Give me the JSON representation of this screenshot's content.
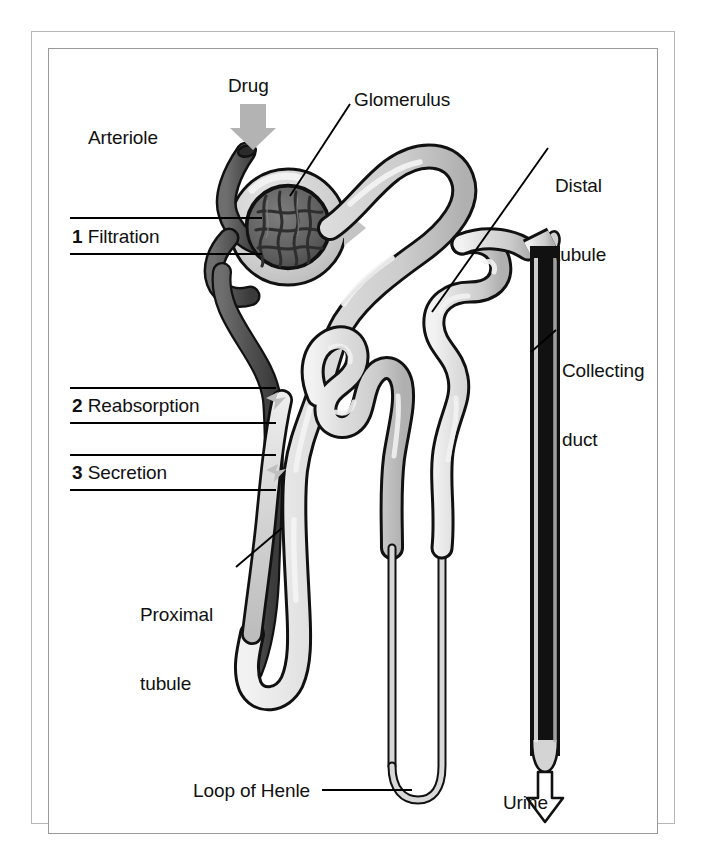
{
  "figure": {
    "domain": "Diagram",
    "background_color": "#ffffff",
    "frame": {
      "outer_border_color": "#b8b8b8",
      "inner_border_color": "#9a9a9a"
    }
  },
  "labels": {
    "arteriole": "Arteriole",
    "drug": "Drug",
    "glomerulus": "Glomerulus",
    "distal_tubule": "Distal\ntubule",
    "distal_tubule_line1": "Distal",
    "distal_tubule_line2": "tubule",
    "collecting_duct_line1": "Collecting",
    "collecting_duct_line2": "duct",
    "proximal_tubule_line1": "Proximal",
    "proximal_tubule_line2": "tubule",
    "loop_of_henle": "Loop of Henle",
    "urine": "Urine"
  },
  "process_steps": [
    {
      "number": "1",
      "name": "Filtration"
    },
    {
      "number": "2",
      "name": "Reabsorption"
    },
    {
      "number": "3",
      "name": "Secretion"
    }
  ],
  "arrows": [
    {
      "name": "drug-inflow-arrow",
      "label": "Drug",
      "direction": "down",
      "style": "solid-gray",
      "color": "#b3b3b3"
    },
    {
      "name": "filtration-flow-arrow",
      "direction": "right",
      "style": "solid-gray",
      "color": "#c4c4c4"
    },
    {
      "name": "urine-outflow-arrow",
      "label": "Urine",
      "direction": "down",
      "style": "outline",
      "color": "#ffffff"
    }
  ],
  "colors": {
    "arteriole_dark": "#595959",
    "arteriole_shadow": "#3f3f3f",
    "tubule_light": "#d2d2d2",
    "tubule_highlight": "#efefef",
    "tubule_shadow": "#a8a8a8",
    "glomerulus_capillary": "#6a6a6a",
    "bowman_capsule": "#cfcfcf",
    "outline": "#111111",
    "text": "#111111",
    "leader_line": "#000000"
  },
  "structures": [
    {
      "name": "afferent-arteriole",
      "shading": "dark"
    },
    {
      "name": "glomerulus",
      "shading": "dark-capillary-tuft"
    },
    {
      "name": "bowmans-capsule",
      "shading": "light"
    },
    {
      "name": "proximal-tubule",
      "shading": "light"
    },
    {
      "name": "loop-of-henle",
      "shading": "light"
    },
    {
      "name": "distal-tubule",
      "shading": "light"
    },
    {
      "name": "collecting-duct",
      "shading": "light"
    }
  ]
}
